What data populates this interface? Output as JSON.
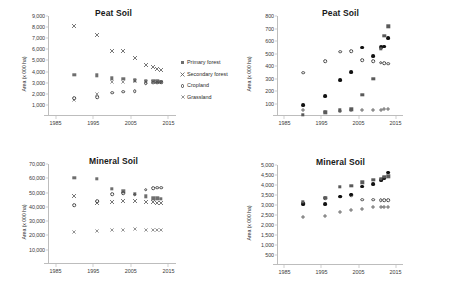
{
  "figure": {
    "ylabel_text": "Area (x 000 ha)",
    "xticks": [
      "1985",
      "1995",
      "2005",
      "2015"
    ],
    "xlim": [
      1983,
      2017
    ]
  },
  "chart_data": [
    {
      "id": "peat-soil-forest",
      "type": "scatter",
      "title": "Peat Soil",
      "xlabel": "",
      "ylabel": "Area (x 000 ha)",
      "xlim": [
        1983,
        2017
      ],
      "ylim": [
        0,
        9000
      ],
      "xticks": [
        "1985",
        "1995",
        "2005",
        "2015"
      ],
      "yticks": [
        "1,000",
        "2,000",
        "3,000",
        "4,000",
        "5,000",
        "6,000",
        "7,000",
        "8,000",
        "9,000"
      ],
      "grid": false,
      "legend_position": "right",
      "series": [
        {
          "name": "Primary forest",
          "marker": "square",
          "points": [
            [
              1990,
              3720
            ],
            [
              1996,
              3680
            ],
            [
              2000,
              3400
            ],
            [
              2003,
              3340
            ],
            [
              2006,
              3200
            ],
            [
              2009,
              3180
            ],
            [
              2011,
              3150
            ],
            [
              2012,
              3120
            ],
            [
              2013,
              3100
            ]
          ]
        },
        {
          "name": "Secondary forest",
          "marker": "x",
          "points": [
            [
              1990,
              8130
            ],
            [
              1996,
              7250
            ],
            [
              2000,
              5880
            ],
            [
              2003,
              5830
            ],
            [
              2006,
              5200
            ],
            [
              2009,
              4600
            ],
            [
              2011,
              4380
            ],
            [
              2012,
              4250
            ],
            [
              2013,
              4150
            ]
          ]
        },
        {
          "name": "Cropland",
          "marker": "circle",
          "points": [
            [
              1990,
              1620
            ],
            [
              1996,
              1700
            ],
            [
              2000,
              2100
            ],
            [
              2003,
              2180
            ],
            [
              2006,
              2220
            ],
            [
              2009,
              2950
            ],
            [
              2011,
              2980
            ],
            [
              2012,
              3010
            ],
            [
              2013,
              3020
            ]
          ]
        },
        {
          "name": "Grassland",
          "marker": "x-small",
          "points": [
            [
              1990,
              1400
            ],
            [
              1996,
              2020
            ],
            [
              2000,
              3080
            ],
            [
              2003,
              3060
            ],
            [
              2006,
              3180
            ],
            [
              2009,
              3080
            ],
            [
              2011,
              3060
            ],
            [
              2012,
              3050
            ],
            [
              2013,
              3040
            ]
          ]
        }
      ]
    },
    {
      "id": "peat-soil-other",
      "type": "scatter",
      "title": "Peat Soil",
      "xlabel": "",
      "ylabel": "Area (x 000 ha)",
      "xlim": [
        1983,
        2017
      ],
      "ylim": [
        0,
        800
      ],
      "xticks": [
        "1985",
        "1995",
        "2005",
        "2015"
      ],
      "yticks": [
        "100",
        "200",
        "300",
        "400",
        "500",
        "600",
        "700",
        "800"
      ],
      "grid": false,
      "legend_position": "right",
      "series": [
        {
          "name": "Settlement",
          "marker": "plus",
          "points": [
            [
              1990,
              45
            ],
            [
              1996,
              35
            ],
            [
              2000,
              40
            ],
            [
              2003,
              45
            ],
            [
              2006,
              48
            ],
            [
              2009,
              50
            ],
            [
              2011,
              52
            ],
            [
              2012,
              53
            ],
            [
              2013,
              54
            ]
          ]
        },
        {
          "name": "Wetland",
          "marker": "circle",
          "points": [
            [
              1990,
              345
            ],
            [
              1996,
              438
            ],
            [
              2000,
              515
            ],
            [
              2003,
              518
            ],
            [
              2006,
              448
            ],
            [
              2009,
              438
            ],
            [
              2011,
              425
            ],
            [
              2012,
              422
            ],
            [
              2013,
              420
            ]
          ]
        },
        {
          "name": "Other land",
          "marker": "fcircle",
          "points": [
            [
              1990,
              85
            ],
            [
              1996,
              162
            ],
            [
              2000,
              290
            ],
            [
              2003,
              350
            ],
            [
              2006,
              548
            ],
            [
              2009,
              482
            ],
            [
              2011,
              552
            ],
            [
              2012,
              555
            ],
            [
              2013,
              622
            ]
          ]
        },
        {
          "name": "Forest Plantation",
          "marker": "fsquare",
          "points": [
            [
              1990,
              8
            ],
            [
              1996,
              30
            ],
            [
              2000,
              45
            ],
            [
              2003,
              55
            ],
            [
              2006,
              168
            ],
            [
              2009,
              300
            ],
            [
              2011,
              540
            ],
            [
              2012,
              640
            ],
            [
              2013,
              718
            ]
          ]
        }
      ]
    },
    {
      "id": "mineral-soil-forest",
      "type": "scatter",
      "title": "Mineral Soil",
      "xlabel": "",
      "ylabel": "Area (x 000 ha)",
      "xlim": [
        1983,
        2017
      ],
      "ylim": [
        0,
        70000
      ],
      "xticks": [
        "1985",
        "1995",
        "2005",
        "2015"
      ],
      "yticks": [
        "10,000",
        "20,000",
        "30,000",
        "40,000",
        "50,000",
        "60,000",
        "70,000"
      ],
      "grid": false,
      "legend_position": "right",
      "series": [
        {
          "name": "Primary forest",
          "marker": "square",
          "points": [
            [
              1990,
              60400
            ],
            [
              1996,
              59800
            ],
            [
              2000,
              52800
            ],
            [
              2003,
              51000
            ],
            [
              2006,
              49000
            ],
            [
              2009,
              47500
            ],
            [
              2011,
              46000
            ],
            [
              2012,
              46000
            ],
            [
              2013,
              45800
            ]
          ]
        },
        {
          "name": "Secondary forest",
          "marker": "x",
          "points": [
            [
              1990,
              47600
            ],
            [
              1996,
              43000
            ],
            [
              2000,
              43200
            ],
            [
              2003,
              44200
            ],
            [
              2006,
              44300
            ],
            [
              2009,
              43500
            ],
            [
              2011,
              43200
            ],
            [
              2012,
              43000
            ],
            [
              2013,
              42800
            ]
          ]
        },
        {
          "name": "Cropland",
          "marker": "circle",
          "points": [
            [
              1990,
              41000
            ],
            [
              1996,
              43800
            ],
            [
              2000,
              48800
            ],
            [
              2003,
              49500
            ],
            [
              2006,
              48500
            ],
            [
              2009,
              52000
            ],
            [
              2011,
              53200
            ],
            [
              2012,
              53300
            ],
            [
              2013,
              53400
            ]
          ]
        },
        {
          "name": "Grassland",
          "marker": "x-small",
          "points": [
            [
              1990,
              22600
            ],
            [
              1996,
              23200
            ],
            [
              2000,
              23600
            ],
            [
              2003,
              23900
            ],
            [
              2006,
              24500
            ],
            [
              2009,
              23900
            ],
            [
              2011,
              23800
            ],
            [
              2012,
              23800
            ],
            [
              2013,
              23700
            ]
          ]
        }
      ]
    },
    {
      "id": "mineral-soil-other",
      "type": "scatter",
      "title": "Mineral Soil",
      "xlabel": "",
      "ylabel": "Area (x 000 ha)",
      "xlim": [
        1983,
        2017
      ],
      "ylim": [
        0,
        5000
      ],
      "xticks": [
        "1985",
        "1995",
        "2005",
        "2015"
      ],
      "yticks": [
        "500",
        "1,000",
        "1,500",
        "2,000",
        "2,500",
        "3,000",
        "3,500",
        "4,000",
        "4,500",
        "5,000"
      ],
      "grid": false,
      "legend_position": "right",
      "series": [
        {
          "name": "Settlement",
          "marker": "plus",
          "points": [
            [
              1990,
              2400
            ],
            [
              1996,
              2440
            ],
            [
              2000,
              2660
            ],
            [
              2003,
              2760
            ],
            [
              2006,
              2800
            ],
            [
              2009,
              2880
            ],
            [
              2011,
              2900
            ],
            [
              2012,
              2910
            ],
            [
              2013,
              2920
            ]
          ]
        },
        {
          "name": "Wetland",
          "marker": "circle",
          "points": [
            [
              1990,
              3100
            ],
            [
              1996,
              3330
            ],
            [
              2000,
              3420
            ],
            [
              2003,
              3480
            ],
            [
              2006,
              3270
            ],
            [
              2009,
              3260
            ],
            [
              2011,
              3250
            ],
            [
              2012,
              3250
            ],
            [
              2013,
              3250
            ]
          ]
        },
        {
          "name": "Other land",
          "marker": "fcircle",
          "points": [
            [
              1990,
              3050
            ],
            [
              1996,
              3050
            ],
            [
              2000,
              3420
            ],
            [
              2003,
              3520
            ],
            [
              2006,
              3920
            ],
            [
              2009,
              4040
            ],
            [
              2011,
              4260
            ],
            [
              2012,
              4350
            ],
            [
              2013,
              4620
            ]
          ]
        },
        {
          "name": "Forest Plantation",
          "marker": "fsquare",
          "points": [
            [
              1990,
              3150
            ],
            [
              1996,
              3350
            ],
            [
              2000,
              3900
            ],
            [
              2003,
              3960
            ],
            [
              2006,
              4140
            ],
            [
              2009,
              4260
            ],
            [
              2011,
              4320
            ],
            [
              2012,
              4400
            ],
            [
              2013,
              4440
            ]
          ]
        }
      ]
    }
  ]
}
